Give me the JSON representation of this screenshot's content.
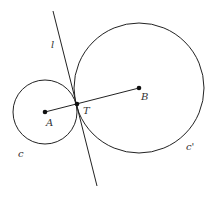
{
  "diagram": {
    "labels": {
      "line": "l",
      "center_small": "A",
      "center_large": "B",
      "tangent_point": "T",
      "circle_small": "c",
      "circle_large": "c'"
    },
    "colors": {
      "stroke": "#222222",
      "text": "#333333"
    }
  }
}
